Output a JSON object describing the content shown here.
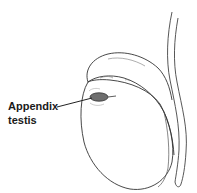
{
  "figure": {
    "labels": [
      {
        "id": "appendix-testis",
        "lines": [
          "Appendix",
          "testis"
        ]
      }
    ]
  },
  "colors": {
    "outline": "#333333",
    "appendix_fill": "#6e6e6e",
    "text": "#1a1a1a",
    "background": "#ffffff"
  }
}
